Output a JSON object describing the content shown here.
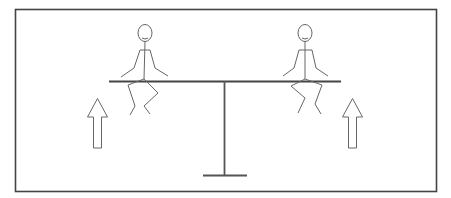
{
  "diagram": {
    "colors": {
      "stroke": "#555555",
      "frame": "#444444",
      "background": "#ffffff"
    },
    "elements": {
      "frame": "border",
      "beam": "seesaw-plank",
      "fulcrum": "seesaw-post",
      "figures": [
        "left-person",
        "right-person"
      ],
      "arrows": [
        {
          "id": "left-arrow",
          "direction": "up"
        },
        {
          "id": "right-arrow",
          "direction": "up"
        }
      ]
    }
  }
}
